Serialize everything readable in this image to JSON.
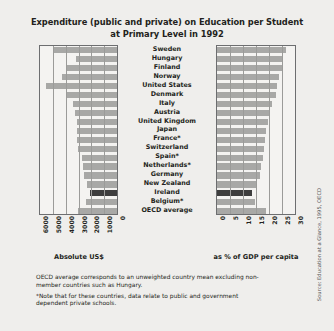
{
  "title": {
    "line1": "Expenditure (public and private) on Education per Student",
    "line2": "at Primary Level in 1992"
  },
  "axis_caption_left": "Absolute US$",
  "axis_caption_right": "as % of GDP per capita",
  "notes": {
    "note1": "OECD average corresponds to an unweighted country mean excluding non-member countries such as Hungary.",
    "note2": "*Note that for these countries, data relate to public and government dependent private schools."
  },
  "source": "Source: Education at a Glance, 1995, OECD",
  "colors": {
    "background": "#efeeec",
    "plot_background": "#f4f3f1",
    "bar": "#a8a8a6",
    "bar_highlight": "#3e3e3e",
    "axis": "#6d6e70",
    "gridline": "#9b9b99",
    "text": "#231f20"
  },
  "chart_data": {
    "type": "bar",
    "orientation": "horizontal",
    "layout": "back-to-back (butterfly) paired bar chart",
    "title": "Expenditure (public and private) on Education per Student at Primary Level in 1992",
    "categories": [
      "Sweden",
      "Hungary",
      "Finland",
      "Norway",
      "United States",
      "Denmark",
      "Italy",
      "Austria",
      "United Kingdom",
      "Japan",
      "France*",
      "Switzerland",
      "Spain*",
      "Netherlands*",
      "Germany",
      "New Zealand",
      "Ireland",
      "Belgium*",
      "OECD average"
    ],
    "highlight_category": "Ireland",
    "series": [
      {
        "name": "Absolute US$",
        "panel": "left",
        "xlabel": "Absolute US$",
        "ticks": [
          6000,
          5000,
          4000,
          3000,
          2000,
          1000,
          0
        ],
        "xlim": [
          6000,
          0
        ],
        "direction": "right-to-left (reversed axis)",
        "values": [
          4900,
          3200,
          4000,
          4250,
          5550,
          3900,
          3400,
          3300,
          3150,
          3100,
          3100,
          3050,
          2700,
          2650,
          2600,
          2350,
          2100,
          2400,
          3050
        ]
      },
      {
        "name": "as % of GDP per capita",
        "panel": "right",
        "xlabel": "as % of GDP per capita",
        "ticks": [
          0,
          5,
          10,
          15,
          20,
          25,
          30
        ],
        "xlim": [
          0,
          30
        ],
        "direction": "left-to-right",
        "values": [
          26.5,
          25.5,
          25.0,
          24.0,
          23.0,
          22.5,
          21.0,
          20.0,
          19.5,
          19.0,
          18.5,
          18.0,
          17.5,
          17.0,
          16.5,
          15.5,
          13.5,
          14.5,
          19.0
        ]
      }
    ],
    "grid": true,
    "legend": "none"
  }
}
